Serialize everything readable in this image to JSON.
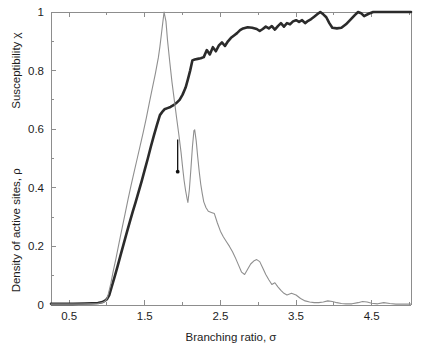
{
  "figure": {
    "background": "#ffffff",
    "plot_left": 51,
    "plot_right": 411,
    "plot_top": 12,
    "plot_bottom": 305
  },
  "chart_data": {
    "type": "line",
    "title": "",
    "subtitle": "",
    "xlabel": "Branching ratio, σ",
    "ylabel_upper": "Susceptibility χ",
    "ylabel_lower": "Density of active sites, ρ",
    "xlim": [
      0.26,
      5.02
    ],
    "ylim": [
      0,
      1
    ],
    "xticks": [
      0.5,
      1.5,
      2.5,
      3.5,
      4.5
    ],
    "xticklabels": [
      "0.5",
      "1.5",
      "2.5",
      "3.5",
      "4.5"
    ],
    "xminorticks": [
      1.0,
      2.0,
      3.0,
      4.0,
      5.0
    ],
    "yticks": [
      0,
      0.2,
      0.4,
      0.6,
      0.8,
      1
    ],
    "yticklabels": [
      "0",
      "0.2",
      "0.4",
      "0.6",
      "0.8",
      "1"
    ],
    "yminorticks": [
      0.1,
      0.3,
      0.5,
      0.7,
      0.9
    ],
    "grid": false,
    "legend": "none",
    "colors": {
      "density": "#2b2b2b",
      "susceptibility": "#8f8f8f",
      "axis": "#8d8d8d",
      "text": "#1d1d1d",
      "marker": "#111111"
    },
    "annotations": [
      {
        "name": "critical-point-arrow",
        "x": 1.935,
        "y_top": 0.565,
        "y_bottom": 0.455,
        "label": ""
      }
    ],
    "series": [
      {
        "name": "Density of active sites, ρ",
        "color": "#2b2b2b",
        "width": 2.6,
        "points": [
          [
            0.26,
            0.004
          ],
          [
            0.4,
            0.004
          ],
          [
            0.55,
            0.004
          ],
          [
            0.7,
            0.005
          ],
          [
            0.8,
            0.006
          ],
          [
            0.88,
            0.007
          ],
          [
            0.94,
            0.01
          ],
          [
            0.98,
            0.016
          ],
          [
            1.0,
            0.02
          ],
          [
            1.03,
            0.034
          ],
          [
            1.06,
            0.06
          ],
          [
            1.1,
            0.095
          ],
          [
            1.14,
            0.132
          ],
          [
            1.18,
            0.17
          ],
          [
            1.22,
            0.208
          ],
          [
            1.26,
            0.245
          ],
          [
            1.3,
            0.282
          ],
          [
            1.34,
            0.318
          ],
          [
            1.38,
            0.352
          ],
          [
            1.42,
            0.388
          ],
          [
            1.46,
            0.424
          ],
          [
            1.5,
            0.462
          ],
          [
            1.54,
            0.5
          ],
          [
            1.58,
            0.54
          ],
          [
            1.62,
            0.578
          ],
          [
            1.66,
            0.614
          ],
          [
            1.7,
            0.648
          ],
          [
            1.74,
            0.662
          ],
          [
            1.76,
            0.668
          ],
          [
            1.8,
            0.672
          ],
          [
            1.84,
            0.676
          ],
          [
            1.88,
            0.682
          ],
          [
            1.92,
            0.69
          ],
          [
            1.96,
            0.7
          ],
          [
            2.0,
            0.718
          ],
          [
            2.04,
            0.742
          ],
          [
            2.07,
            0.77
          ],
          [
            2.1,
            0.8
          ],
          [
            2.13,
            0.835
          ],
          [
            2.16,
            0.838
          ],
          [
            2.2,
            0.84
          ],
          [
            2.24,
            0.842
          ],
          [
            2.28,
            0.846
          ],
          [
            2.32,
            0.87
          ],
          [
            2.36,
            0.855
          ],
          [
            2.4,
            0.88
          ],
          [
            2.44,
            0.866
          ],
          [
            2.48,
            0.886
          ],
          [
            2.52,
            0.896
          ],
          [
            2.56,
            0.884
          ],
          [
            2.6,
            0.9
          ],
          [
            2.64,
            0.912
          ],
          [
            2.68,
            0.92
          ],
          [
            2.72,
            0.928
          ],
          [
            2.76,
            0.938
          ],
          [
            2.8,
            0.944
          ],
          [
            2.86,
            0.948
          ],
          [
            2.92,
            0.946
          ],
          [
            2.98,
            0.942
          ],
          [
            3.02,
            0.935
          ],
          [
            3.06,
            0.942
          ],
          [
            3.1,
            0.95
          ],
          [
            3.14,
            0.944
          ],
          [
            3.18,
            0.952
          ],
          [
            3.22,
            0.94
          ],
          [
            3.26,
            0.952
          ],
          [
            3.3,
            0.962
          ],
          [
            3.34,
            0.95
          ],
          [
            3.38,
            0.962
          ],
          [
            3.42,
            0.958
          ],
          [
            3.46,
            0.968
          ],
          [
            3.5,
            0.972
          ],
          [
            3.54,
            0.966
          ],
          [
            3.58,
            0.972
          ],
          [
            3.62,
            0.962
          ],
          [
            3.66,
            0.97
          ],
          [
            3.7,
            0.976
          ],
          [
            3.74,
            0.984
          ],
          [
            3.78,
            0.992
          ],
          [
            3.82,
            1.0
          ],
          [
            3.86,
            0.992
          ],
          [
            3.9,
            0.982
          ],
          [
            3.94,
            0.962
          ],
          [
            3.98,
            0.946
          ],
          [
            4.04,
            0.944
          ],
          [
            4.1,
            0.946
          ],
          [
            4.16,
            0.958
          ],
          [
            4.22,
            0.974
          ],
          [
            4.28,
            0.99
          ],
          [
            4.32,
            1.0
          ],
          [
            4.36,
            0.996
          ],
          [
            4.4,
            0.986
          ],
          [
            4.46,
            0.994
          ],
          [
            4.52,
            1.0
          ],
          [
            4.6,
            1.0
          ],
          [
            4.7,
            1.0
          ],
          [
            4.82,
            1.0
          ],
          [
            4.94,
            1.0
          ],
          [
            5.02,
            1.0
          ]
        ]
      },
      {
        "name": "Susceptibility χ",
        "color": "#8f8f8f",
        "width": 1.1,
        "points": [
          [
            0.26,
            0.003
          ],
          [
            0.45,
            0.003
          ],
          [
            0.62,
            0.003
          ],
          [
            0.78,
            0.004
          ],
          [
            0.88,
            0.005
          ],
          [
            0.94,
            0.008
          ],
          [
            0.98,
            0.014
          ],
          [
            1.0,
            0.022
          ],
          [
            1.02,
            0.04
          ],
          [
            1.05,
            0.072
          ],
          [
            1.08,
            0.112
          ],
          [
            1.12,
            0.16
          ],
          [
            1.16,
            0.212
          ],
          [
            1.2,
            0.262
          ],
          [
            1.24,
            0.312
          ],
          [
            1.28,
            0.362
          ],
          [
            1.32,
            0.41
          ],
          [
            1.36,
            0.455
          ],
          [
            1.4,
            0.5
          ],
          [
            1.44,
            0.545
          ],
          [
            1.48,
            0.59
          ],
          [
            1.52,
            0.638
          ],
          [
            1.56,
            0.69
          ],
          [
            1.6,
            0.74
          ],
          [
            1.64,
            0.79
          ],
          [
            1.68,
            0.845
          ],
          [
            1.7,
            0.882
          ],
          [
            1.72,
            0.925
          ],
          [
            1.74,
            0.968
          ],
          [
            1.755,
            1.0
          ],
          [
            1.78,
            0.968
          ],
          [
            1.8,
            0.905
          ],
          [
            1.83,
            0.83
          ],
          [
            1.86,
            0.76
          ],
          [
            1.89,
            0.7
          ],
          [
            1.92,
            0.64
          ],
          [
            1.95,
            0.582
          ],
          [
            1.98,
            0.52
          ],
          [
            2.0,
            0.47
          ],
          [
            2.02,
            0.425
          ],
          [
            2.04,
            0.39
          ],
          [
            2.06,
            0.362
          ],
          [
            2.07,
            0.35
          ],
          [
            2.09,
            0.395
          ],
          [
            2.11,
            0.465
          ],
          [
            2.13,
            0.54
          ],
          [
            2.15,
            0.595
          ],
          [
            2.16,
            0.598
          ],
          [
            2.18,
            0.56
          ],
          [
            2.2,
            0.505
          ],
          [
            2.22,
            0.455
          ],
          [
            2.24,
            0.412
          ],
          [
            2.26,
            0.38
          ],
          [
            2.28,
            0.352
          ],
          [
            2.31,
            0.332
          ],
          [
            2.34,
            0.32
          ],
          [
            2.38,
            0.316
          ],
          [
            2.42,
            0.312
          ],
          [
            2.46,
            0.28
          ],
          [
            2.5,
            0.252
          ],
          [
            2.54,
            0.232
          ],
          [
            2.58,
            0.216
          ],
          [
            2.62,
            0.2
          ],
          [
            2.66,
            0.182
          ],
          [
            2.7,
            0.16
          ],
          [
            2.74,
            0.136
          ],
          [
            2.78,
            0.112
          ],
          [
            2.82,
            0.104
          ],
          [
            2.86,
            0.122
          ],
          [
            2.9,
            0.14
          ],
          [
            2.94,
            0.15
          ],
          [
            2.98,
            0.155
          ],
          [
            3.02,
            0.148
          ],
          [
            3.06,
            0.126
          ],
          [
            3.1,
            0.104
          ],
          [
            3.14,
            0.086
          ],
          [
            3.18,
            0.07
          ],
          [
            3.22,
            0.076
          ],
          [
            3.26,
            0.062
          ],
          [
            3.3,
            0.05
          ],
          [
            3.34,
            0.04
          ],
          [
            3.38,
            0.034
          ],
          [
            3.44,
            0.04
          ],
          [
            3.5,
            0.034
          ],
          [
            3.56,
            0.022
          ],
          [
            3.62,
            0.014
          ],
          [
            3.68,
            0.01
          ],
          [
            3.74,
            0.008
          ],
          [
            3.8,
            0.008
          ],
          [
            3.86,
            0.01
          ],
          [
            3.92,
            0.014
          ],
          [
            3.98,
            0.012
          ],
          [
            4.04,
            0.008
          ],
          [
            4.1,
            0.005
          ],
          [
            4.16,
            0.004
          ],
          [
            4.24,
            0.004
          ],
          [
            4.32,
            0.008
          ],
          [
            4.38,
            0.012
          ],
          [
            4.44,
            0.01
          ],
          [
            4.5,
            0.006
          ],
          [
            4.58,
            0.004
          ],
          [
            4.66,
            0.008
          ],
          [
            4.74,
            0.005
          ],
          [
            4.82,
            0.003
          ],
          [
            4.92,
            0.003
          ],
          [
            5.02,
            0.003
          ]
        ]
      }
    ]
  }
}
